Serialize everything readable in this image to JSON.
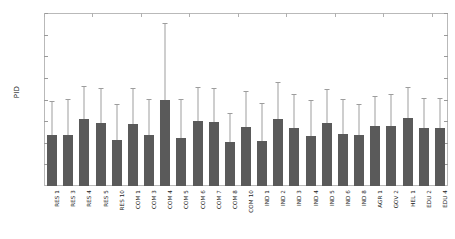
{
  "chart_data": {
    "type": "bar",
    "title": "",
    "xlabel": "",
    "ylabel": "PID",
    "ylim": [
      0,
      0.04
    ],
    "yticks": [
      0,
      0.005,
      0.01,
      0.015,
      0.02,
      0.025,
      0.03,
      0.035,
      0.04
    ],
    "ytick_labels": [
      "0",
      "0.005",
      "0.01",
      "0.015",
      "0.02",
      "0.025",
      "0.03",
      "0.035",
      "0.04"
    ],
    "grid": false,
    "legend": null,
    "error_bars": "upper-only",
    "bar_color": "#5a5a5a",
    "error_color": "#9d9d9d",
    "categories": [
      "RES 1",
      "RES 3",
      "RES 4",
      "RES 5",
      "RES 10",
      "COM 1",
      "COM 3",
      "COM 4",
      "COM 5",
      "COM 6",
      "COM 7",
      "COM 8",
      "COM 10",
      "IND 1",
      "IND 2",
      "IND 3",
      "IND 4",
      "IND 5",
      "IND 6",
      "IND 8",
      "AGR 1",
      "GOV 2",
      "HEL 1",
      "EDU 2",
      "EDU 4"
    ],
    "values": [
      0.0118,
      0.0118,
      0.0155,
      0.0146,
      0.0106,
      0.0143,
      0.0118,
      0.0198,
      0.0112,
      0.015,
      0.0148,
      0.0102,
      0.0137,
      0.0105,
      0.0155,
      0.0135,
      0.0116,
      0.0146,
      0.012,
      0.0118,
      0.0138,
      0.0138,
      0.0158,
      0.0133,
      0.0133
    ],
    "error_upper": [
      0.0194,
      0.02,
      0.023,
      0.0224,
      0.0188,
      0.0224,
      0.02,
      0.0375,
      0.02,
      0.0226,
      0.0224,
      0.0166,
      0.0218,
      0.019,
      0.0238,
      0.021,
      0.0196,
      0.0222,
      0.0198,
      0.0188,
      0.0206,
      0.021,
      0.0226,
      0.0202,
      0.0202
    ]
  }
}
